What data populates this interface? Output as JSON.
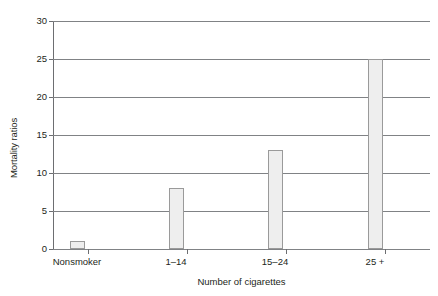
{
  "chart_data": {
    "type": "bar",
    "title": "",
    "subtitle": "",
    "xlabel": "Number of cigarettes",
    "ylabel": "Mortality ratios",
    "categories": [
      "Nonsmoker",
      "1–14",
      "15–24",
      "25 +"
    ],
    "values": [
      1,
      8,
      13,
      25
    ],
    "series": [
      {
        "name": "Mortality ratios",
        "values": [
          1,
          8,
          13,
          25
        ]
      }
    ],
    "ylim": [
      0,
      30
    ],
    "yticks": [
      0,
      5,
      10,
      15,
      20,
      25,
      30
    ],
    "ytick_labels": [
      "0",
      "5",
      "10",
      "15",
      "20",
      "25",
      "30"
    ],
    "grid": "horizontal",
    "legend": "none",
    "bar_fill_color": "#eeeeee",
    "bar_border_color": "#9a9a9a",
    "grid_color": "#808285",
    "axis_color": "#6d6e71",
    "text_color": "#231f20",
    "background_color": "#ffffff"
  }
}
